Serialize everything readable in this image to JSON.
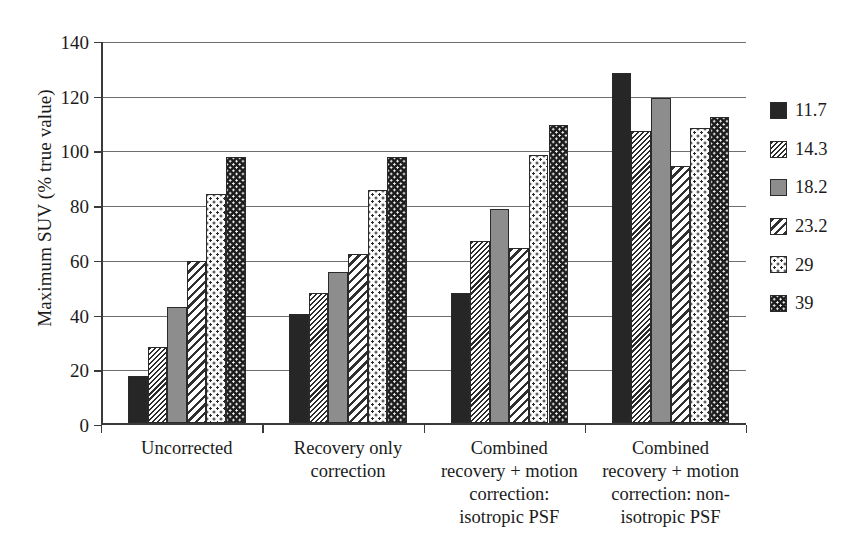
{
  "chart_data": {
    "type": "bar",
    "title": "",
    "xlabel": "",
    "ylabel": "Maximum SUV (% true value)",
    "ylim": [
      0,
      140
    ],
    "yticks": [
      0,
      20,
      40,
      60,
      80,
      100,
      120,
      140
    ],
    "ytick_labels": [
      "0",
      "20",
      "40",
      "60",
      "80",
      "100",
      "120",
      "140"
    ],
    "grid": "horizontal",
    "legend_position": "right",
    "legend_title": "",
    "categories": [
      "Uncorrected",
      "Recovery only correction",
      "Combined recovery + motion correction: isotropic PSF",
      "Combined recovery + motion correction: non-isotropic PSF"
    ],
    "category_lines": [
      [
        "Uncorrected"
      ],
      [
        "Recovery only",
        "correction"
      ],
      [
        "Combined",
        "recovery + motion",
        "correction:",
        "isotropic PSF"
      ],
      [
        "Combined",
        "recovery + motion",
        "correction: non-",
        "isotropic PSF"
      ]
    ],
    "series": [
      {
        "name": "11.7",
        "pattern": "solid-dark",
        "values": [
          17.5,
          40.0,
          47.5,
          128.0
        ]
      },
      {
        "name": "14.3",
        "pattern": "hatch-dense",
        "values": [
          28.0,
          47.5,
          66.5,
          107.0
        ]
      },
      {
        "name": "18.2",
        "pattern": "solid-gray",
        "values": [
          42.5,
          55.5,
          78.5,
          119.0
        ]
      },
      {
        "name": "23.2",
        "pattern": "hatch-wide",
        "values": [
          59.5,
          62.0,
          64.0,
          94.0
        ]
      },
      {
        "name": "29",
        "pattern": "dots-light",
        "values": [
          84.0,
          85.5,
          98.0,
          108.0
        ]
      },
      {
        "name": "39",
        "pattern": "dots-dark",
        "values": [
          97.5,
          97.5,
          109.0,
          112.0
        ]
      }
    ],
    "colors": {
      "solid-dark": "#262626",
      "solid-gray": "#8d8d8d",
      "hatch-dense": "#f2f2f2",
      "hatch-wide": "#f4f4f4",
      "dots-light": "#fbfbfb",
      "dots-dark": "#1d1d1d",
      "axis": "#3a3a3a",
      "grid": "#6e6e6e",
      "background": "#ffffff"
    }
  }
}
